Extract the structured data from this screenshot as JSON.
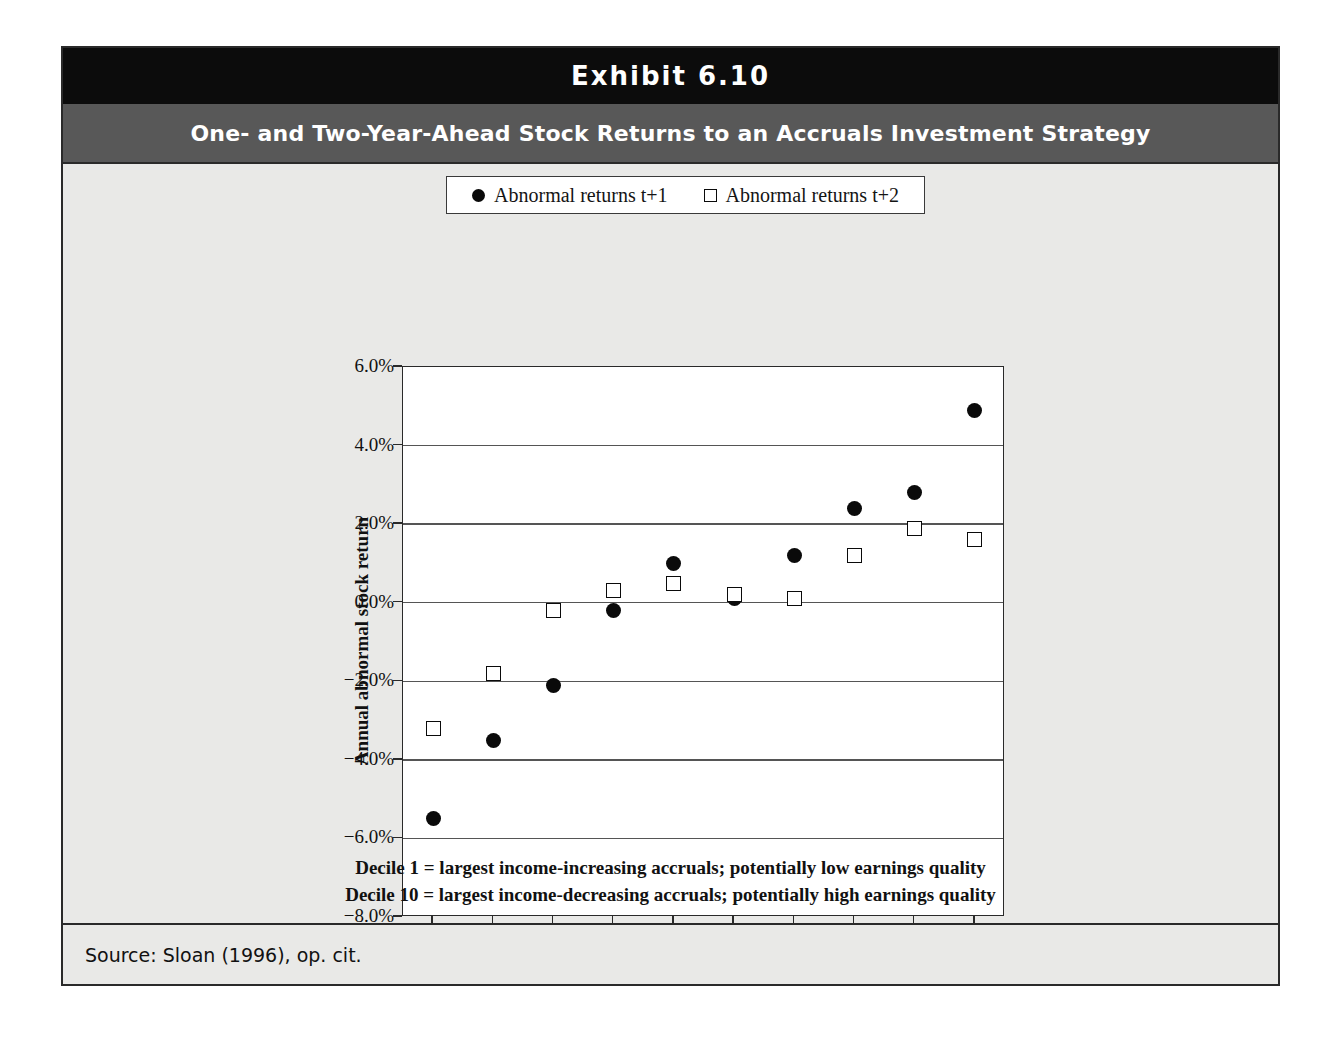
{
  "exhibit": {
    "label": "Exhibit 6.10",
    "subtitle": "One- and Two-Year-Ahead Stock Returns to an Accruals Investment Strategy",
    "source": "Source: Sloan (1996), op. cit.",
    "notes": [
      "Decile 1 = largest income-increasing accruals; potentially low earnings quality",
      "Decile 10 = largest income-decreasing accruals; potentially high earnings quality"
    ]
  },
  "colors": {
    "title_bar": "#0c0c0c",
    "subtitle_bar": "#585858",
    "panel": "#e9e9e7",
    "plot_bg": "#ffffff",
    "marker": "#0a0a0a",
    "gridline": "#555555"
  },
  "chart_data": {
    "type": "scatter",
    "title": "One- and Two-Year-Ahead Stock Returns to an Accruals Investment Strategy",
    "xlabel": "Accruals Decile",
    "ylabel": "Annual abnormal stock return",
    "categories": [
      "1",
      "2",
      "3",
      "4",
      "5",
      "6",
      "7",
      "8",
      "9",
      "10"
    ],
    "x": [
      1,
      2,
      3,
      4,
      5,
      6,
      7,
      8,
      9,
      10
    ],
    "ylim": [
      -8.0,
      6.0
    ],
    "ytick_labels": [
      "6.0%",
      "4.0%",
      "2.0%",
      "0.0%",
      "−2.0%",
      "−4.0%",
      "−6.0%",
      "−8.0%"
    ],
    "ytick_values": [
      6.0,
      4.0,
      2.0,
      0.0,
      -2.0,
      -4.0,
      -6.0,
      -8.0
    ],
    "grid": true,
    "legend_position": "top-center",
    "series": [
      {
        "name": "Abnormal returns t+1",
        "marker": "filled-circle",
        "values": [
          -5.5,
          -3.5,
          -2.1,
          -0.2,
          1.0,
          0.1,
          1.2,
          2.4,
          2.8,
          4.9
        ]
      },
      {
        "name": "Abnormal returns t+2",
        "marker": "open-square",
        "values": [
          -3.2,
          -1.8,
          -0.2,
          0.3,
          0.5,
          0.2,
          0.1,
          1.2,
          1.9,
          1.6
        ]
      }
    ]
  }
}
